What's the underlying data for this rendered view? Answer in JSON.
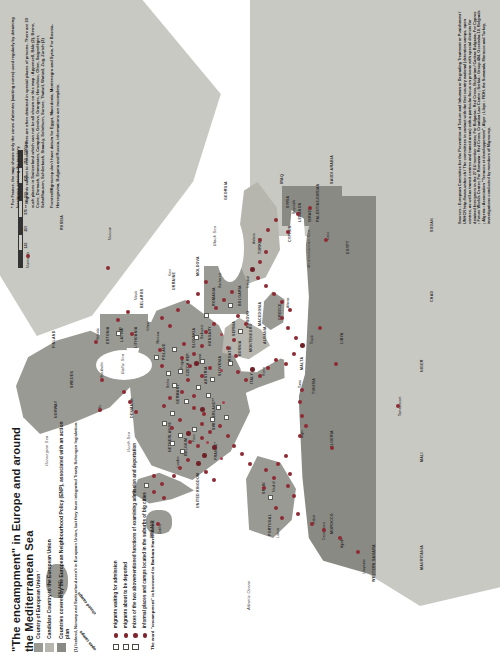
{
  "poster": {
    "title": "\"The encampment\" in Europe and around the Mediterranean Sea",
    "borrow_note": "The word \"encampment\" is borrowed to Barbara Harrell-Bond."
  },
  "legend": {
    "area_items": [
      {
        "swatch": "a",
        "label": "Country of European Union ¹"
      },
      {
        "swatch": "b",
        "label": "Candidate Country to the European Union"
      },
      {
        "swatch": "c",
        "label": "Countries covered by the European Neighbourhood Policy (ENP), associated with an action plan"
      }
    ],
    "footnote": "(1) Iceland, Norway and Switzerland aren't in European Union, but they have integrated Treaty Schengen legislation.",
    "column_headers": [
      "open camps",
      "closed camps"
    ],
    "marker_items": [
      {
        "square": true,
        "circle": true,
        "label": "migrants waiting for admission"
      },
      {
        "square": true,
        "circle": true,
        "label": "migrants about to be deported"
      },
      {
        "square": true,
        "circle": true,
        "label": "mixes of the two abovementioned functions of examining admission and deportation"
      },
      {
        "square": false,
        "circle": true,
        "label": "informal places and camps located in the suburbs of big cities"
      }
    ]
  },
  "notes": {
    "top": [
      "* For France, the map shows only the zones d'attentes (waiting zones) used regularly by detaining foreigners entering the territory.",
      "** Migrants subject to removal orders are often detained in special places of prisons. There are 23 such places in Switzerland which can not be all shown on this map : Appenzell, Bâle (2), Berne, Coire, Dornach, Emmeraten, Campden, Genève, Granges, Herschiso, Olten, Saignelégier, Schaffhausen, Schlierbach, Staad-y, Solothurn, Sursee, Thalwil, Wattwil, Zug, Zurich (2)",
      "Frontex/Migreurop don't have datum for Egypt, Macedonia, Montenegro and Syria. For Bosnia-Herzegovina, Bulgaria and Russia, informations are incomplete."
    ]
  },
  "sources": {
    "text": "Sources : European Committee for the Prevention of Torture and Inhuman or Degrading Treatment or Punishment / UNHCR http://www.unhcr.ch / The committees in contact with the first country national (detention camps, open centres, as well as transit centres and transit areas) with a particular focus on prisons with special districts for detained foreigners in the 27 EU member states; For Bulgaria : Red Cross, Bulgarian / Caritas Bulgaria; For Cyprus : Future Worlds Center; For Romania : Red Cross, Croatian Law Centre ; Serbia : Group 484, Ocsevska 10, Belgrade ; Algeria : Association \"Terraces et developpement\", Alger ; Libye : FIDH, the Sumanda, Morocco and Turkey, investigations conducted by members of Migreurop."
  },
  "scale": {
    "ticks": [
      "0",
      "125",
      "250",
      "375",
      "500",
      "625",
      "750",
      "1000 km"
    ],
    "unit_label": "1000 km"
  },
  "map": {
    "seas": [
      {
        "name": "Black Sea",
        "x": 424,
        "y": 158
      },
      {
        "name": "Mediterranean Sea",
        "x": 437,
        "y": 276
      },
      {
        "name": "Atlantic Ocean",
        "x": 46,
        "y": 352
      },
      {
        "name": "North Sea",
        "x": 206,
        "y": 150
      },
      {
        "name": "Baltic Sea",
        "x": 297,
        "y": 104
      },
      {
        "name": "Norwegian Sea",
        "x": 215,
        "y": 40
      }
    ],
    "countries": [
      {
        "name": "ICELAND",
        "x": 84,
        "y": 62,
        "cls": "eu"
      },
      {
        "name": "NORWAY",
        "x": 243,
        "y": 56,
        "cls": "eu"
      },
      {
        "name": "SWEDEN",
        "x": 276,
        "y": 74,
        "cls": "eu"
      },
      {
        "name": "FINLAND",
        "x": 320,
        "y": 56,
        "cls": "eu"
      },
      {
        "name": "RUSSIA",
        "x": 430,
        "y": 58,
        "cls": "land"
      },
      {
        "name": "ESTONIA",
        "x": 331,
        "y": 108,
        "cls": "eu"
      },
      {
        "name": "LATVIA",
        "x": 333,
        "y": 122,
        "cls": "eu"
      },
      {
        "name": "LITHUANIA",
        "x": 330,
        "y": 136,
        "cls": "eu"
      },
      {
        "name": "BELARUS",
        "x": 366,
        "y": 140,
        "cls": "land"
      },
      {
        "name": "DENMARK",
        "x": 256,
        "y": 132,
        "cls": "eu"
      },
      {
        "name": "IRELAND",
        "x": 147,
        "y": 150,
        "cls": "eu"
      },
      {
        "name": "UNITED KINGDOM",
        "x": 172,
        "y": 160,
        "cls": "eu"
      },
      {
        "name": "NETHERLANDS",
        "x": 232,
        "y": 170,
        "cls": "eu"
      },
      {
        "name": "GERMANY",
        "x": 268,
        "y": 178,
        "cls": "eu"
      },
      {
        "name": "POLAND",
        "x": 313,
        "y": 164,
        "cls": "eu"
      },
      {
        "name": "UKRAINE",
        "x": 383,
        "y": 172,
        "cls": "land"
      },
      {
        "name": "BELGIUM",
        "x": 225,
        "y": 186,
        "cls": "eu"
      },
      {
        "name": "CZECH REP.",
        "x": 300,
        "y": 186,
        "cls": "eu"
      },
      {
        "name": "SLOVAKIA",
        "x": 326,
        "y": 192,
        "cls": "eu"
      },
      {
        "name": "AUSTRIA",
        "x": 292,
        "y": 204,
        "cls": "eu"
      },
      {
        "name": "HUNGARY",
        "x": 327,
        "y": 206,
        "cls": "eu"
      },
      {
        "name": "MOLDOVA",
        "x": 394,
        "y": 196,
        "cls": "land"
      },
      {
        "name": "ROMANIA",
        "x": 367,
        "y": 210,
        "cls": "eu"
      },
      {
        "name": "FRANCE*",
        "x": 217,
        "y": 214,
        "cls": "eu"
      },
      {
        "name": "SWITZERLAND**",
        "x": 249,
        "y": 212,
        "cls": "eu"
      },
      {
        "name": "SLOVENIA",
        "x": 300,
        "y": 218,
        "cls": "eu"
      },
      {
        "name": "CROATIA",
        "x": 310,
        "y": 228,
        "cls": "cand"
      },
      {
        "name": "BOSNIA",
        "x": 318,
        "y": 238,
        "cls": "land"
      },
      {
        "name": "SERBIA",
        "x": 336,
        "y": 234,
        "cls": "cand"
      },
      {
        "name": "BULGARIA",
        "x": 368,
        "y": 238,
        "cls": "eu"
      },
      {
        "name": "MONTENEGRO",
        "x": 327,
        "y": 249,
        "cls": "land"
      },
      {
        "name": "KOSOVO",
        "x": 339,
        "y": 248,
        "cls": "land"
      },
      {
        "name": "MACEDONIA",
        "x": 345,
        "y": 257,
        "cls": "cand"
      },
      {
        "name": "ALBANIA",
        "x": 331,
        "y": 262,
        "cls": "cand"
      },
      {
        "name": "ITALY",
        "x": 287,
        "y": 250,
        "cls": "eu"
      },
      {
        "name": "GREECE",
        "x": 352,
        "y": 277,
        "cls": "eu"
      },
      {
        "name": "TURKEY",
        "x": 418,
        "y": 258,
        "cls": "cand"
      },
      {
        "name": "CYPRUS",
        "x": 432,
        "y": 288,
        "cls": "eu"
      },
      {
        "name": "SYRIA",
        "x": 462,
        "y": 288,
        "cls": "land"
      },
      {
        "name": "LEBANON",
        "x": 452,
        "y": 298,
        "cls": "enp"
      },
      {
        "name": "ISRAEL",
        "x": 452,
        "y": 310,
        "cls": "enp"
      },
      {
        "name": "PALESTINE",
        "x": 456,
        "y": 318,
        "cls": "land"
      },
      {
        "name": "JORDAN",
        "x": 470,
        "y": 316,
        "cls": "enp"
      },
      {
        "name": "IRAQ",
        "x": 486,
        "y": 280,
        "cls": "land"
      },
      {
        "name": "SAUDI ARABIA",
        "x": 492,
        "y": 330,
        "cls": "land"
      },
      {
        "name": "PORTUGAL",
        "x": 146,
        "y": 268,
        "cls": "eu"
      },
      {
        "name": "SPAIN",
        "x": 178,
        "y": 260,
        "cls": "eu"
      },
      {
        "name": "MALTA",
        "x": 300,
        "y": 300,
        "cls": "eu"
      },
      {
        "name": "MOROCCO",
        "x": 143,
        "y": 330,
        "cls": "enp"
      },
      {
        "name": "ALGERIA",
        "x": 228,
        "y": 330,
        "cls": "enp"
      },
      {
        "name": "TUNISIA",
        "x": 279,
        "y": 312,
        "cls": "enp"
      },
      {
        "name": "LIBYA",
        "x": 330,
        "y": 340,
        "cls": "enp"
      },
      {
        "name": "EGYPT",
        "x": 420,
        "y": 346,
        "cls": "enp"
      },
      {
        "name": "MAURITANIA",
        "x": 110,
        "y": 420,
        "cls": "land"
      },
      {
        "name": "MALI",
        "x": 210,
        "y": 420,
        "cls": "land"
      },
      {
        "name": "NIGER",
        "x": 300,
        "y": 420,
        "cls": "land"
      },
      {
        "name": "CHAD",
        "x": 370,
        "y": 430,
        "cls": "land"
      },
      {
        "name": "SUDAN",
        "x": 440,
        "y": 430,
        "cls": "land"
      },
      {
        "name": "WESTERN SAHARA",
        "x": 100,
        "y": 372,
        "cls": "land"
      },
      {
        "name": "GEORGIA",
        "x": 474,
        "y": 224,
        "cls": "land"
      }
    ],
    "cities": [
      {
        "name": "Murmansk",
        "x": 396,
        "y": 26
      },
      {
        "name": "Oslo",
        "x": 252,
        "y": 98
      },
      {
        "name": "Stockholm",
        "x": 286,
        "y": 100
      },
      {
        "name": "Helsinki",
        "x": 324,
        "y": 96
      },
      {
        "name": "Riga",
        "x": 330,
        "y": 118
      },
      {
        "name": "Vilnius",
        "x": 333,
        "y": 134
      },
      {
        "name": "Minsk",
        "x": 364,
        "y": 134
      },
      {
        "name": "Moscow",
        "x": 424,
        "y": 108
      },
      {
        "name": "Warsaw",
        "x": 320,
        "y": 160
      },
      {
        "name": "Kiev",
        "x": 388,
        "y": 168
      },
      {
        "name": "Berlin",
        "x": 276,
        "y": 166
      },
      {
        "name": "Prague",
        "x": 295,
        "y": 182
      },
      {
        "name": "Vienna",
        "x": 300,
        "y": 198
      },
      {
        "name": "Budapest",
        "x": 325,
        "y": 202
      },
      {
        "name": "Bucharest",
        "x": 376,
        "y": 216
      },
      {
        "name": "Paris",
        "x": 222,
        "y": 192
      },
      {
        "name": "London",
        "x": 196,
        "y": 176
      },
      {
        "name": "Dublin",
        "x": 146,
        "y": 158
      },
      {
        "name": "Madrid",
        "x": 172,
        "y": 272
      },
      {
        "name": "Lisbon",
        "x": 142,
        "y": 276
      },
      {
        "name": "Rome",
        "x": 288,
        "y": 262
      },
      {
        "name": "Athens",
        "x": 356,
        "y": 286
      },
      {
        "name": "Istanbul",
        "x": 390,
        "y": 250
      },
      {
        "name": "Ankara",
        "x": 420,
        "y": 254
      },
      {
        "name": "Beyrouth",
        "x": 450,
        "y": 294
      },
      {
        "name": "Cairo",
        "x": 424,
        "y": 326
      },
      {
        "name": "Tripoli",
        "x": 320,
        "y": 312
      },
      {
        "name": "Tunis",
        "x": 280,
        "y": 300
      },
      {
        "name": "Alger",
        "x": 232,
        "y": 300
      },
      {
        "name": "Rabat",
        "x": 148,
        "y": 312
      },
      {
        "name": "Casablanca",
        "x": 140,
        "y": 322
      },
      {
        "name": "Tamanrasset",
        "x": 262,
        "y": 398
      },
      {
        "name": "Agadir",
        "x": 128,
        "y": 340
      },
      {
        "name": "Laayoune",
        "x": 104,
        "y": 362
      }
    ]
  }
}
